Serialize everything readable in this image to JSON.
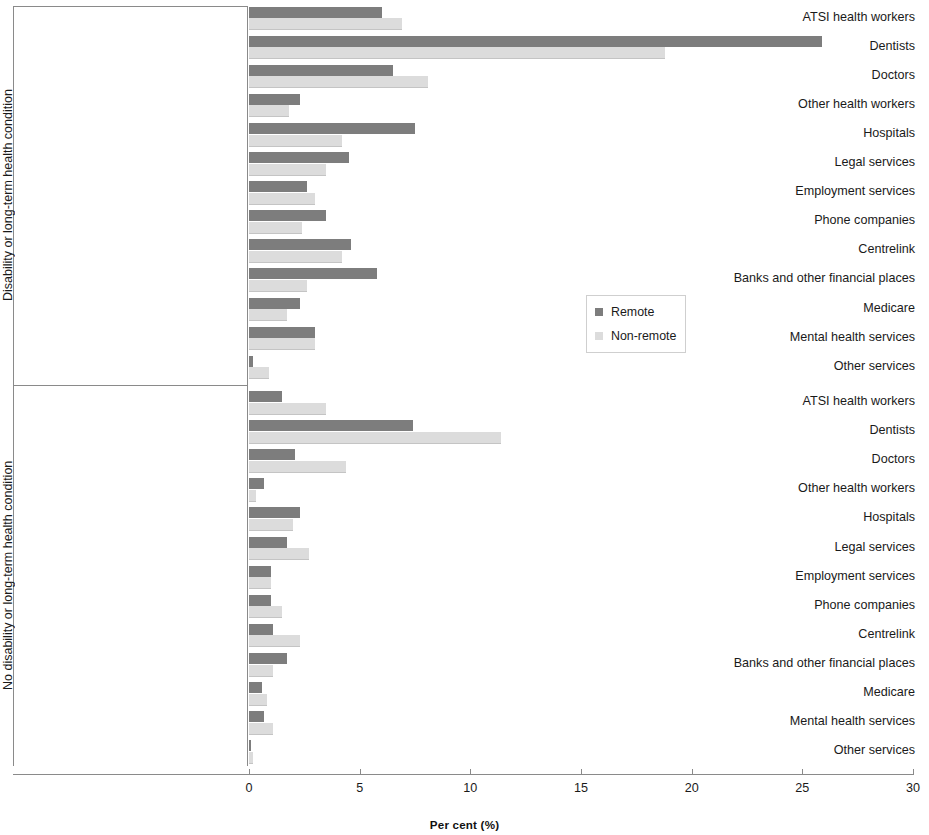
{
  "chart_data": {
    "type": "bar",
    "orientation": "horizontal",
    "title": "",
    "xlabel": "Per cent  (%)",
    "ylabel": "",
    "xlim": [
      0,
      30
    ],
    "xticks": [
      0,
      5,
      10,
      15,
      20,
      25,
      30
    ],
    "xtick_labels": [
      "0",
      "5",
      "10",
      "15",
      "20",
      "25",
      "30"
    ],
    "grid": false,
    "legend_position": "center-right",
    "legend": [
      "Remote",
      "Non-remote"
    ],
    "colors": {
      "remote": "#7d7d7d",
      "non_remote": "#dcdcdc",
      "axis": "#8a8a8a",
      "text": "#1a1a1a"
    },
    "panels": [
      {
        "group_label": "Disability or long-term health condition",
        "categories": [
          "ATSI health workers",
          "Dentists",
          "Doctors",
          "Other health workers",
          "Hospitals",
          "Legal services",
          "Employment services",
          "Phone companies",
          "Centrelink",
          "Banks and other financial places",
          "Medicare",
          "Mental health services",
          "Other services"
        ],
        "series": [
          {
            "name": "Remote",
            "values": [
              6.0,
              25.9,
              6.5,
              2.3,
              7.5,
              4.5,
              2.6,
              3.5,
              4.6,
              5.8,
              2.3,
              3.0,
              0.2
            ]
          },
          {
            "name": "Non-remote",
            "values": [
              6.9,
              18.8,
              8.1,
              1.8,
              4.2,
              3.5,
              3.0,
              2.4,
              4.2,
              2.6,
              1.7,
              3.0,
              0.9
            ]
          }
        ]
      },
      {
        "group_label": "No disability or long-term health condition",
        "categories": [
          "ATSI health workers",
          "Dentists",
          "Doctors",
          "Other health workers",
          "Hospitals",
          "Legal services",
          "Employment services",
          "Phone companies",
          "Centrelink",
          "Banks and other financial places",
          "Medicare",
          "Mental health services",
          "Other services"
        ],
        "series": [
          {
            "name": "Remote",
            "values": [
              1.5,
              7.4,
              2.1,
              0.7,
              2.3,
              1.7,
              1.0,
              1.0,
              1.1,
              1.7,
              0.6,
              0.7,
              0.1
            ]
          },
          {
            "name": "Non-remote",
            "values": [
              3.5,
              11.4,
              4.4,
              0.3,
              2.0,
              2.7,
              1.0,
              1.5,
              2.3,
              1.1,
              0.8,
              1.1,
              0.2
            ]
          }
        ]
      }
    ]
  }
}
